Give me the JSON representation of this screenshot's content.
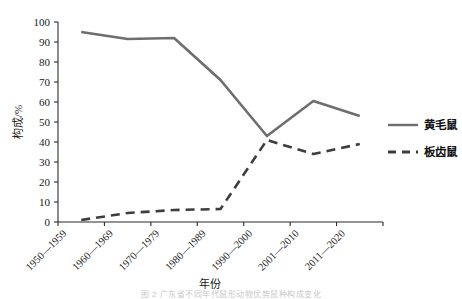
{
  "chart_data": {
    "type": "line",
    "title": "",
    "xlabel": "年份",
    "ylabel": "构成/%",
    "categories": [
      "1950—1959",
      "1960—1969",
      "1970—1979",
      "1980—1989",
      "1990—2000",
      "2001—2010",
      "2011—2020"
    ],
    "ylim": [
      0,
      100
    ],
    "yticks": [
      0,
      10,
      20,
      30,
      40,
      50,
      60,
      70,
      80,
      90,
      100
    ],
    "ytick_labels": [
      "0",
      "10",
      "20",
      "30",
      "40",
      "50",
      "60",
      "70",
      "80",
      "90",
      "100"
    ],
    "grid": false,
    "legend_position": "right",
    "series": [
      {
        "name": "黄毛鼠",
        "style": "solid",
        "color": "#6e6e6e",
        "values": [
          95,
          91.5,
          92,
          71,
          43,
          60.5,
          53
        ]
      },
      {
        "name": "板齿鼠",
        "style": "dashed",
        "color": "#3d3d3d",
        "values": [
          1,
          4.5,
          6,
          6.5,
          41,
          34,
          39
        ]
      }
    ]
  },
  "legend": {
    "items": [
      {
        "label": "黄毛鼠",
        "style": "solid"
      },
      {
        "label": "板齿鼠",
        "style": "dashed"
      }
    ]
  },
  "caption": "图 2 广东省不同年代鼠形动物优势鼠种构成变化"
}
